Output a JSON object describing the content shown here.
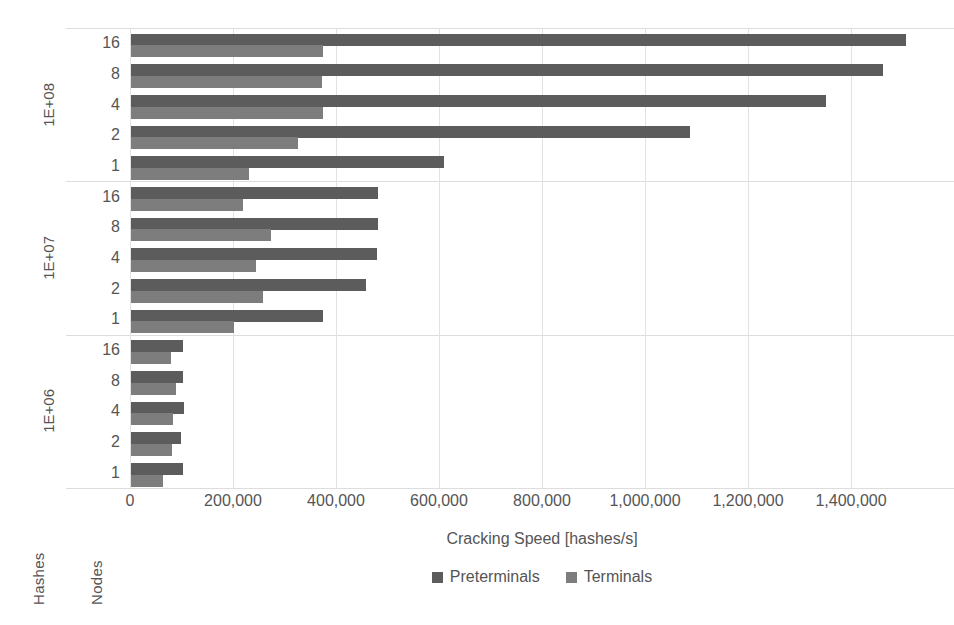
{
  "chart_data": {
    "type": "bar",
    "orientation": "horizontal",
    "title": "",
    "xlabel": "Cracking Speed [hashes/s]",
    "ylabel": "",
    "xlim": [
      0,
      1600000
    ],
    "xticks": [
      0,
      200000,
      400000,
      600000,
      800000,
      1000000,
      1200000,
      1400000
    ],
    "xtick_labels": [
      "0",
      "200,000",
      "400,000",
      "600,000",
      "800,000",
      "1,000,000",
      "1,200,000",
      "1,400,000"
    ],
    "grid": true,
    "legend_position": "bottom",
    "axis_group_label": "Hashes",
    "axis_category_label": "Nodes",
    "series": [
      {
        "name": "Preterminals",
        "color": "#5c5c5c"
      },
      {
        "name": "Terminals",
        "color": "#7d7d7d"
      }
    ],
    "groups": [
      {
        "label": "1E+08",
        "categories": [
          "16",
          "8",
          "4",
          "2",
          "1"
        ],
        "preterminals": [
          1505000,
          1460000,
          1350000,
          1085000,
          608000
        ],
        "terminals": [
          373000,
          370000,
          372000,
          325000,
          230000
        ]
      },
      {
        "label": "1E+07",
        "categories": [
          "16",
          "8",
          "4",
          "2",
          "1"
        ],
        "preterminals": [
          480000,
          480000,
          478000,
          456000,
          373000
        ],
        "terminals": [
          218000,
          272000,
          243000,
          257000,
          200000
        ]
      },
      {
        "label": "1E+06",
        "categories": [
          "16",
          "8",
          "4",
          "2",
          "1"
        ],
        "preterminals": [
          100000,
          100000,
          103000,
          97000,
          100000
        ]
      }
    ],
    "terminals_1e06": [
      78000,
      88000,
      82000,
      80000,
      62000
    ]
  }
}
